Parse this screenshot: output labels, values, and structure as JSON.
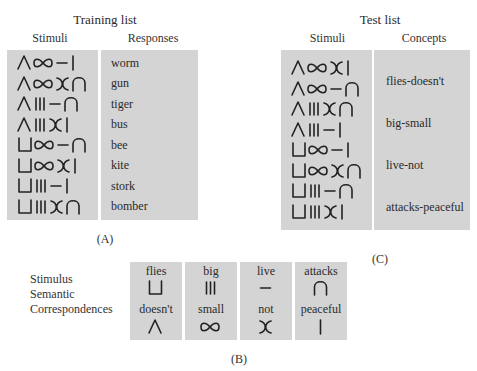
{
  "training": {
    "title": "Training list",
    "col_stimuli": "Stimuli",
    "col_responses": "Responses",
    "rows": [
      {
        "stimulus": [
          "doesnt",
          "small",
          "live",
          "peaceful"
        ],
        "response": "worm"
      },
      {
        "stimulus": [
          "doesnt",
          "small",
          "not",
          "attacks"
        ],
        "response": "gun"
      },
      {
        "stimulus": [
          "doesnt",
          "big",
          "live",
          "attacks"
        ],
        "response": "tiger"
      },
      {
        "stimulus": [
          "doesnt",
          "big",
          "not",
          "peaceful"
        ],
        "response": "bus"
      },
      {
        "stimulus": [
          "flies",
          "small",
          "live",
          "attacks"
        ],
        "response": "bee"
      },
      {
        "stimulus": [
          "flies",
          "small",
          "not",
          "peaceful"
        ],
        "response": "kite"
      },
      {
        "stimulus": [
          "flies",
          "big",
          "live",
          "peaceful"
        ],
        "response": "stork"
      },
      {
        "stimulus": [
          "flies",
          "big",
          "not",
          "attacks"
        ],
        "response": "bomber"
      }
    ],
    "panel_label": "(A)"
  },
  "test": {
    "title": "Test list",
    "col_stimuli": "Stimuli",
    "col_concepts": "Concepts",
    "rows": [
      {
        "stimulus": [
          "doesnt",
          "small",
          "not",
          "peaceful"
        ]
      },
      {
        "stimulus": [
          "doesnt",
          "small",
          "live",
          "attacks"
        ]
      },
      {
        "stimulus": [
          "doesnt",
          "big",
          "not",
          "attacks"
        ]
      },
      {
        "stimulus": [
          "doesnt",
          "big",
          "live",
          "peaceful"
        ]
      },
      {
        "stimulus": [
          "flies",
          "small",
          "live",
          "peaceful"
        ]
      },
      {
        "stimulus": [
          "flies",
          "small",
          "not",
          "attacks"
        ]
      },
      {
        "stimulus": [
          "flies",
          "big",
          "live",
          "attacks"
        ]
      },
      {
        "stimulus": [
          "flies",
          "big",
          "not",
          "peaceful"
        ]
      }
    ],
    "concepts": [
      "flies-doesn't",
      "big-small",
      "live-not",
      "attacks-peaceful"
    ],
    "panel_label": "(C)"
  },
  "correspondences": {
    "label_lines": [
      "Stimulus",
      "Semantic",
      "Correspondences"
    ],
    "pairs": [
      {
        "top_word": "flies",
        "top_glyph": "flies",
        "bottom_word": "doesn't",
        "bottom_glyph": "doesnt"
      },
      {
        "top_word": "big",
        "top_glyph": "big",
        "bottom_word": "small",
        "bottom_glyph": "small"
      },
      {
        "top_word": "live",
        "top_glyph": "live",
        "bottom_word": "not",
        "bottom_glyph": "not"
      },
      {
        "top_word": "attacks",
        "top_glyph": "attacks",
        "bottom_word": "peaceful",
        "bottom_glyph": "peaceful"
      }
    ],
    "panel_label": "(B)"
  },
  "colors": {
    "box_gray": "#d4d4d4",
    "ink": "#222222"
  }
}
